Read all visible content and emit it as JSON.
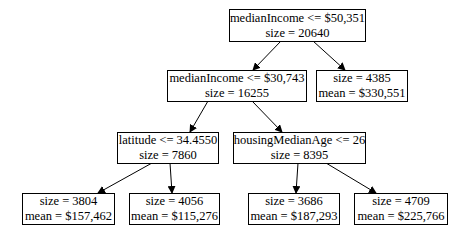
{
  "tree": {
    "nodes": [
      {
        "id": "root",
        "line1": "medianIncome <= $50,351",
        "line2": "size = 20640"
      },
      {
        "id": "n1",
        "line1": "medianIncome <= $30,743",
        "line2": "size = 16255"
      },
      {
        "id": "n2",
        "line1": "size = 4385",
        "line2": "mean = $330,551"
      },
      {
        "id": "n3",
        "line1": "latitude <= 34.4550",
        "line2": "size = 7860"
      },
      {
        "id": "n4",
        "line1": "housingMedianAge <= 26",
        "line2": "size = 8395"
      },
      {
        "id": "n5",
        "line1": "size = 3804",
        "line2": "mean = $157,462"
      },
      {
        "id": "n6",
        "line1": "size = 4056",
        "line2": "mean = $115,276"
      },
      {
        "id": "n7",
        "line1": "size = 3686",
        "line2": "mean = $187,293"
      },
      {
        "id": "n8",
        "line1": "size = 4709",
        "line2": "mean = $225,766"
      }
    ],
    "edges": [
      [
        "root",
        "n1"
      ],
      [
        "root",
        "n2"
      ],
      [
        "n1",
        "n3"
      ],
      [
        "n1",
        "n4"
      ],
      [
        "n3",
        "n5"
      ],
      [
        "n3",
        "n6"
      ],
      [
        "n4",
        "n7"
      ],
      [
        "n4",
        "n8"
      ]
    ]
  }
}
